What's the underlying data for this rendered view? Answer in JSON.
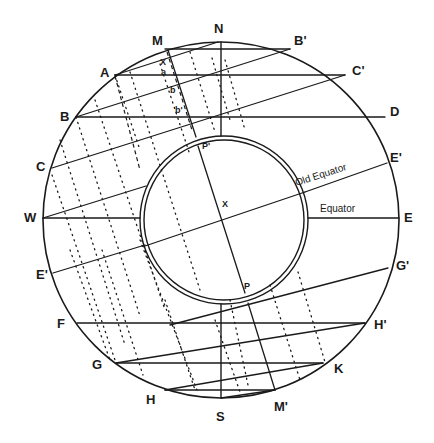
{
  "diagram": {
    "outer_circle": {
      "cx": 221,
      "cy": 220,
      "r": 178
    },
    "inner_circle": {
      "cx": 224,
      "cy": 220,
      "r_outer": 84,
      "r_inner": 80
    },
    "colors": {
      "line": "#1a1a1a",
      "background": "#ffffff"
    },
    "labels": {
      "N": "N",
      "S": "S",
      "E": "E",
      "W": "W",
      "M": "M",
      "M_prime": "M'",
      "A": "A",
      "B": "B",
      "C": "C",
      "D": "D",
      "B_prime": "B'",
      "C_prime": "C'",
      "E_prime_left": "E'",
      "E_prime_right": "E'",
      "F": "F",
      "G": "G",
      "H": "H",
      "K": "K",
      "G_prime": "G'",
      "H_prime": "H'",
      "X_center": "X",
      "X_small": "X",
      "a": "a",
      "b": "b",
      "b_prime": "b'",
      "P": "P",
      "P_prime": "P'",
      "old_equator": "Old Equator",
      "equator": "Equator"
    }
  }
}
